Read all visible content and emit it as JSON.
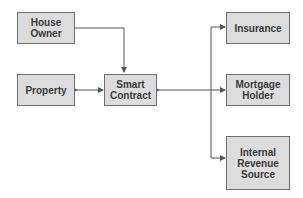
{
  "diagram": {
    "type": "flowchart",
    "nodes": {
      "house_owner": {
        "label": "House\nOwner"
      },
      "property": {
        "label": "Property"
      },
      "smart_contract": {
        "label": "Smart\nContract"
      },
      "insurance": {
        "label": "Insurance"
      },
      "mortgage_holder": {
        "label": "Mortgage\nHolder"
      },
      "internal_revenue_source": {
        "label": "Internal\nRevenue\nSource"
      }
    },
    "edges": [
      {
        "from": "House Owner",
        "to": "Smart Contract",
        "direction": "one-way"
      },
      {
        "from": "Property",
        "to": "Smart Contract",
        "direction": "two-way"
      },
      {
        "from": "Smart Contract",
        "to": "Insurance / Mortgage Holder / Internal Revenue Source",
        "direction": "two-way"
      }
    ],
    "colors": {
      "node_fill": "#dcdcdc",
      "node_border": "#6e6e6e",
      "text": "#3a3a3a",
      "edge": "#555555"
    }
  }
}
